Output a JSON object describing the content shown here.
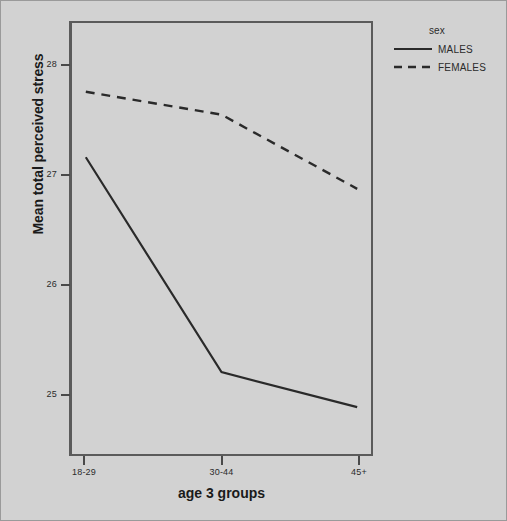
{
  "chart_data": {
    "type": "line",
    "title": "",
    "xlabel": "age 3 groups",
    "ylabel": "Mean total perceived stress",
    "categories": [
      "18-29",
      "30-44",
      "45+"
    ],
    "series": [
      {
        "name": "MALES",
        "style": "solid",
        "values": [
          27.17,
          25.2,
          24.88
        ]
      },
      {
        "name": "FEMALES",
        "style": "dashed",
        "values": [
          27.77,
          27.56,
          26.88
        ]
      }
    ],
    "ylim": [
      24.45,
      28.4
    ],
    "yticks": [
      25,
      26,
      27,
      28
    ],
    "ytick_labels": [
      "25",
      "26",
      "27",
      "28"
    ],
    "grid": false,
    "legend": {
      "title": "sex",
      "position": "right-top",
      "entries": [
        {
          "label": "MALES",
          "style": "solid"
        },
        {
          "label": "FEMALES",
          "style": "dashed"
        }
      ]
    }
  },
  "colors": {
    "background": "#d2d2d2",
    "panel_border": "#5b5b5b",
    "line": "#2a2a2a",
    "text": "#1a1a1a",
    "tick_text": "#2b2b2b"
  }
}
